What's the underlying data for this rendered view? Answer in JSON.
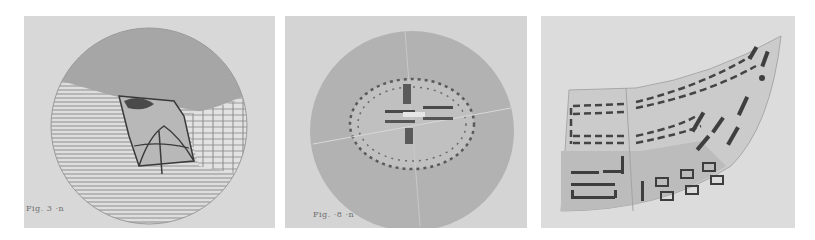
{
  "figures": [
    {
      "id": "panel-1",
      "caption": "Fig. 3 ·n",
      "subject": "circular perspective view with hatched side walls and central structure",
      "colors": {
        "background": "#d8d8d8",
        "sky": "#a8a8a8",
        "hatch": "#8a8a8a",
        "ink": "#3a3a3a"
      }
    },
    {
      "id": "panel-2",
      "caption": "Fig. ·8 ·n",
      "subject": "circular plan with dotted elliptical ring and central cross axis",
      "colors": {
        "background": "#d4d4d4",
        "disc": "#b4b4b4",
        "inner": "#c2c2c2",
        "dots": "#5a5a5a"
      }
    },
    {
      "id": "panel-3",
      "caption": "",
      "subject": "curved site plan with dashed building rows and blocks",
      "colors": {
        "background": "#dcdcdc",
        "site": "#cbcbcb",
        "lower_blocks": "#bdbdbd",
        "ink": "#444444"
      }
    }
  ]
}
